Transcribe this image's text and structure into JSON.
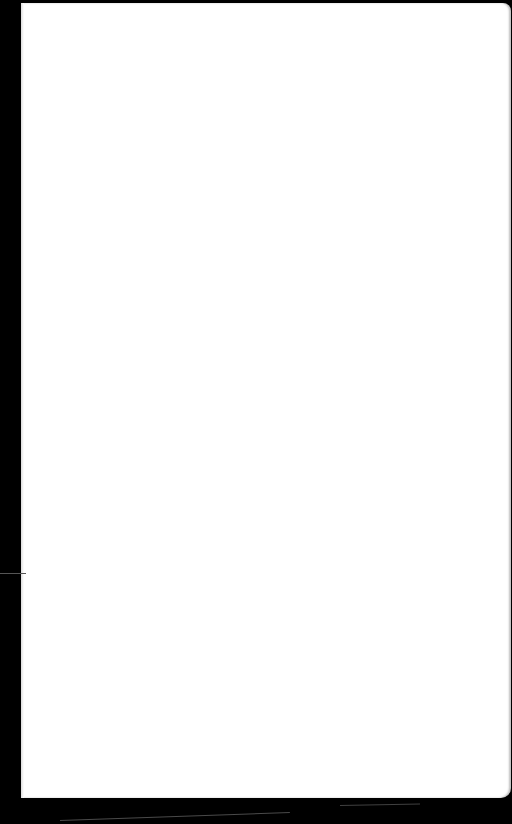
{
  "scene": {
    "description": "Blank white sheet on black background",
    "sheet_color": "#ffffff",
    "background_color": "#000000"
  }
}
